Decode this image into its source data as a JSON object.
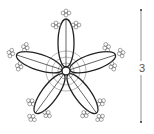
{
  "diagram": {
    "petal_count": 5,
    "picot_clusters_per_petal": 3,
    "center_rings": 3,
    "dimension_label": "3",
    "colors": {
      "stroke": "#222222",
      "picot_stroke": "#666666",
      "ring_stroke": "#888888",
      "dimension_stroke": "#777777"
    }
  }
}
